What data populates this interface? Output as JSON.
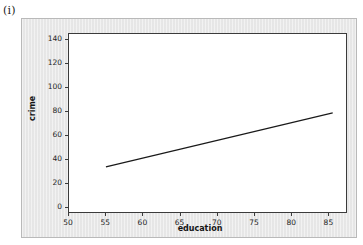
{
  "figure": {
    "caption": "(i)"
  },
  "chart_data": {
    "type": "line",
    "title": "",
    "xlabel": "education",
    "ylabel": "crime",
    "xlim": [
      50,
      87.5
    ],
    "ylim": [
      -5,
      145
    ],
    "xticks": [
      50,
      55,
      60,
      65,
      70,
      75,
      80,
      85
    ],
    "yticks": [
      0,
      20,
      40,
      60,
      80,
      100,
      120,
      140
    ],
    "xtick_labels": [
      "50",
      "55",
      "60",
      "65",
      "70",
      "75",
      "80",
      "85"
    ],
    "ytick_labels": [
      "0",
      "20",
      "40",
      "60",
      "80",
      "100",
      "120",
      "140"
    ],
    "grid": false,
    "legend": false,
    "series": [
      {
        "name": "fitted regression line",
        "x": [
          55.0,
          85.7
        ],
        "values": [
          33.0,
          78.5
        ],
        "style": "solid",
        "color": "#1a1a1a",
        "width": 1.2
      }
    ]
  },
  "colors": {
    "panel_background": "#e9e9e9",
    "plot_background": "#ffffff",
    "frame": "#3b3b3b",
    "line": "#1a1a1a",
    "text": "#1f1f1f"
  }
}
